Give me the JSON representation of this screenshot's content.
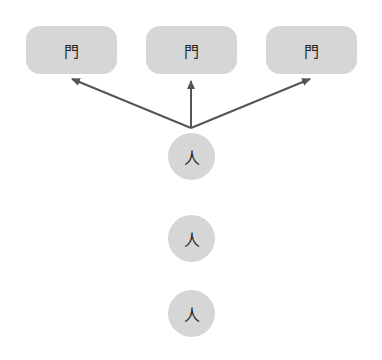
{
  "diagram": {
    "colors": {
      "node_fill": "#d6d6d6",
      "edge": "#555555",
      "text": "#222222"
    },
    "targets": [
      {
        "id": "door-1",
        "label": "門"
      },
      {
        "id": "door-2",
        "label": "門"
      },
      {
        "id": "door-3",
        "label": "門"
      }
    ],
    "people": [
      {
        "id": "person-1",
        "label": "人"
      },
      {
        "id": "person-2",
        "label": "人"
      },
      {
        "id": "person-3",
        "label": "人"
      }
    ],
    "edges": [
      {
        "from": "person-1",
        "to": "door-1"
      },
      {
        "from": "person-1",
        "to": "door-2"
      },
      {
        "from": "person-1",
        "to": "door-3"
      }
    ]
  }
}
